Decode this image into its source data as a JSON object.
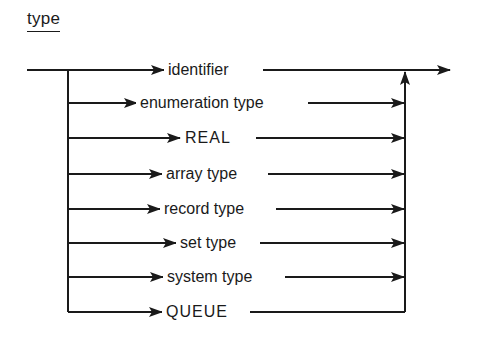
{
  "title": "type",
  "diagram": {
    "kind": "syntax-diagram",
    "entry": "type",
    "alternatives": [
      {
        "label": "identifier",
        "y": 70,
        "x": 168,
        "caps": false
      },
      {
        "label": "enumeration type",
        "y": 103,
        "x": 140,
        "caps": false
      },
      {
        "label": "REAL",
        "y": 138,
        "x": 186,
        "caps": true
      },
      {
        "label": "array type",
        "y": 174,
        "x": 166,
        "caps": false
      },
      {
        "label": "record type",
        "y": 209,
        "x": 164,
        "caps": false
      },
      {
        "label": "set type",
        "y": 243,
        "x": 179,
        "caps": false
      },
      {
        "label": "system type",
        "y": 277,
        "x": 166,
        "caps": false
      },
      {
        "label": "QUEUE",
        "y": 312,
        "x": 166,
        "caps": true
      }
    ]
  },
  "labels": {
    "a0": "identifier",
    "a1": "enumeration type",
    "a2": "REAL",
    "a3": "array type",
    "a4": "record type",
    "a5": "set type",
    "a6": "system type",
    "a7": "QUEUE"
  }
}
